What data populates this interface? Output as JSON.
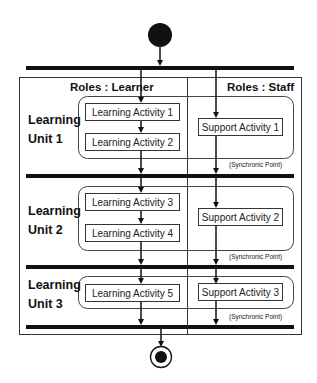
{
  "diagram": {
    "type": "UML activity diagram",
    "colors": {
      "line": "#111111",
      "frame": "#333333",
      "background": "#ffffff"
    },
    "start_node": {
      "label": "initial-node"
    },
    "end_node": {
      "label": "final-node"
    },
    "swimlanes": [
      {
        "label": "Roles : Learner"
      },
      {
        "label": "Roles : Staff"
      }
    ],
    "units": [
      {
        "line1": "Learning",
        "line2": "Unit 1",
        "learner_activities": [
          "Learning Activity 1",
          "Learning Activity 2"
        ],
        "staff_activities": [
          "Support Activity 1"
        ],
        "sync_label": "(Synchronic Point)"
      },
      {
        "line1": "Learning",
        "line2": "Unit 2",
        "learner_activities": [
          "Learning Activity 3",
          "Learning Activity 4"
        ],
        "staff_activities": [
          "Support Activity 2"
        ],
        "sync_label": "(Synchronic Point)"
      },
      {
        "line1": "Learning",
        "line2": "Unit 3",
        "learner_activities": [
          "Learning Activity 5"
        ],
        "staff_activities": [
          "Support Activity 3"
        ],
        "sync_label": "(Synchronic Point)"
      }
    ]
  }
}
